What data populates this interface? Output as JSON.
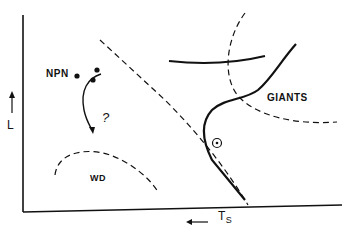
{
  "diagram": {
    "axes": {
      "y_label": "L",
      "x_label": "T",
      "x_label_sub": "S"
    },
    "regions": {
      "npn": "NPN",
      "giants": "GIANTS",
      "wd": "WD",
      "question": "?"
    },
    "symbols": {
      "sun": "sun-symbol"
    },
    "colors": {
      "ink": "#111111",
      "background": "#ffffff"
    }
  }
}
